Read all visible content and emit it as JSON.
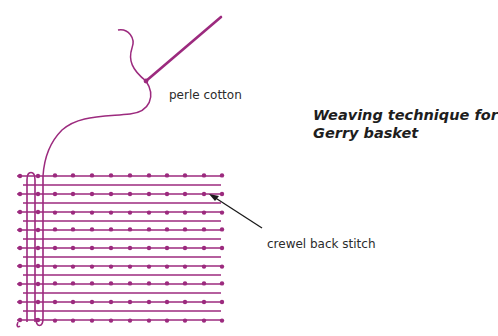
{
  "title": {
    "line1": "Weaving technique for",
    "line2": "Gerry basket"
  },
  "labels": {
    "perle_cotton": "perle cotton",
    "crewel_back_stitch": "crewel back stitch"
  },
  "colors": {
    "thread": "#9c2a7e",
    "arrow": "#1a1a1a",
    "text": "#2b2b2b"
  },
  "diagram": {
    "grid": {
      "x_start": 17,
      "x_end": 223,
      "dotted_rows_y": [
        176,
        194,
        212,
        230,
        248,
        266,
        284,
        302,
        320
      ],
      "plain_rows_y": [
        185,
        203,
        221,
        239,
        257,
        275,
        293,
        311
      ],
      "dot_columns_x": [
        20,
        38,
        55,
        73,
        92,
        111,
        130,
        149,
        167,
        185,
        204,
        222
      ]
    },
    "needle": {
      "tip": [
        221,
        17
      ],
      "eye": [
        146,
        81
      ]
    },
    "arrow": {
      "from": [
        262,
        228
      ],
      "to": [
        210,
        195
      ]
    }
  }
}
